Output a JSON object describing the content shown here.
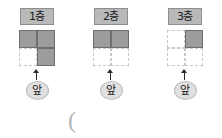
{
  "page": {
    "background_color": "#ffffff",
    "fill_color": "#9c9c9c",
    "label_chip_color": "#b9b9b9",
    "oval_color": "#e0e0e0",
    "grid_line_color": "#c9c9c9"
  },
  "figures": [
    {
      "label": "1층",
      "front_label": "앞",
      "arrow": "up-arrow",
      "grid": {
        "rows": 2,
        "cols": 2,
        "filled": [
          [
            true,
            true
          ],
          [
            false,
            true
          ]
        ],
        "filled_count": 3
      }
    },
    {
      "label": "2층",
      "front_label": "앞",
      "arrow": "up-arrow",
      "grid": {
        "rows": 2,
        "cols": 2,
        "filled": [
          [
            true,
            true
          ],
          [
            false,
            false
          ]
        ],
        "filled_count": 2
      }
    },
    {
      "label": "3층",
      "front_label": "앞",
      "arrow": "up-arrow",
      "grid": {
        "rows": 2,
        "cols": 2,
        "filled": [
          [
            false,
            true
          ],
          [
            false,
            false
          ]
        ],
        "filled_count": 1
      }
    }
  ],
  "annotations": {
    "paren_mark": "("
  }
}
